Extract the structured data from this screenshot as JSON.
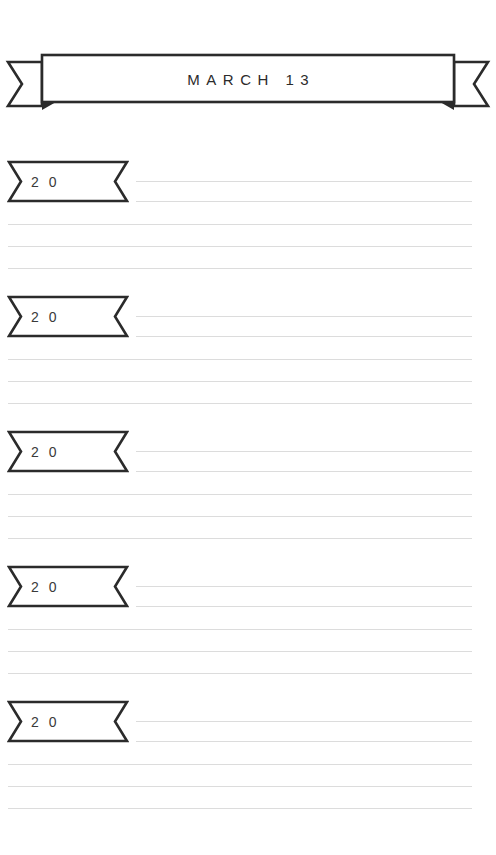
{
  "page": {
    "background_color": "#ffffff",
    "ink_color": "#2b2b2b",
    "rule_color": "#dcdcdc",
    "width": 496,
    "height": 855
  },
  "header": {
    "title": "MARCH 13",
    "ribbon_icon": "ribbon-banner-icon"
  },
  "entries": [
    {
      "year_label": "2 0",
      "tag_icon": "ribbon-tag-icon",
      "lines": 5
    },
    {
      "year_label": "2 0",
      "tag_icon": "ribbon-tag-icon",
      "lines": 5
    },
    {
      "year_label": "2 0",
      "tag_icon": "ribbon-tag-icon",
      "lines": 5
    },
    {
      "year_label": "2 0",
      "tag_icon": "ribbon-tag-icon",
      "lines": 5
    },
    {
      "year_label": "2 0",
      "tag_icon": "ribbon-tag-icon",
      "lines": 5
    }
  ]
}
